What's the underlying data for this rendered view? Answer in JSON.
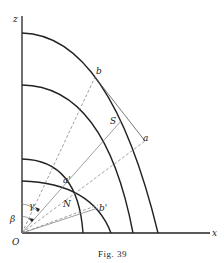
{
  "figure": {
    "caption": "Fig. 39",
    "axes": {
      "vertical": "z",
      "horizontal": "x",
      "origin": "O"
    },
    "points": {
      "b": "b",
      "S": "S",
      "a": "a",
      "a_prime": "a'",
      "N": "N",
      "b_prime": "b'"
    },
    "angles": {
      "beta": "β",
      "gamma": "γ"
    }
  }
}
